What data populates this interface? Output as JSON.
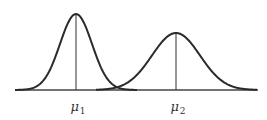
{
  "figure": {
    "colors": {
      "curve": "#2a2a2a",
      "axis": "#444444",
      "mean_line": "#333333",
      "background": "#ffffff"
    },
    "axis": {
      "y": 90,
      "x_start": 15,
      "x_end": 258
    },
    "curves": [
      {
        "name": "distribution-1",
        "mean_x": 76,
        "peak_y": 14,
        "sigma_px": 16,
        "x_start": 15,
        "x_end": 137
      },
      {
        "name": "distribution-2",
        "mean_x": 176,
        "peak_y": 33,
        "sigma_px": 24,
        "x_start": 96,
        "x_end": 257
      }
    ],
    "labels": [
      {
        "symbol": "μ",
        "subscript": "1",
        "x": 76
      },
      {
        "symbol": "μ",
        "subscript": "2",
        "x": 176
      }
    ]
  }
}
